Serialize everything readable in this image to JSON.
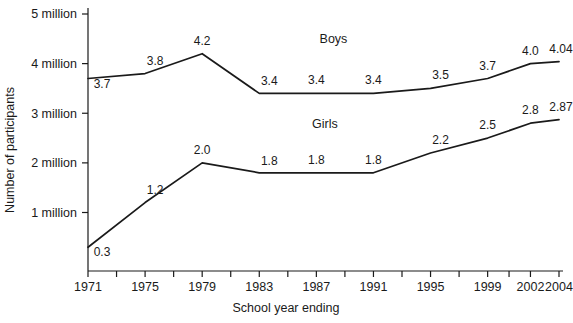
{
  "chart_data": {
    "type": "line",
    "title": "",
    "xlabel": "School year ending",
    "ylabel": "Number of participants",
    "categories": [
      "1971",
      "1975",
      "1979",
      "1983",
      "1987",
      "1991",
      "1995",
      "1999",
      "2002",
      "2004"
    ],
    "x_tick_labels": [
      "1971",
      "1975",
      "1979",
      "1983",
      "1987",
      "1991",
      "1995",
      "1999",
      "2002",
      "2004"
    ],
    "y_tick_labels": [
      "1 million",
      "2 million",
      "3 million",
      "4 million",
      "5 million"
    ],
    "y_tick_values": [
      1,
      2,
      3,
      4,
      5
    ],
    "ylim": [
      0,
      5
    ],
    "xlim": [
      1971,
      2004
    ],
    "grid": false,
    "legend_position": "inline-labels",
    "units": "millions of participants",
    "series": [
      {
        "name": "Boys",
        "values": [
          3.7,
          3.8,
          4.2,
          3.4,
          3.4,
          3.4,
          3.5,
          3.7,
          4.0,
          4.04
        ],
        "labels": [
          "3.7",
          "3.8",
          "4.2",
          "3.4",
          "3.4",
          "3.4",
          "3.5",
          "3.7",
          "4.0",
          "4.04"
        ],
        "color": "#1a1a1a"
      },
      {
        "name": "Girls",
        "values": [
          0.3,
          1.2,
          2.0,
          1.8,
          1.8,
          1.8,
          2.2,
          2.5,
          2.8,
          2.87
        ],
        "labels": [
          "0.3",
          "1.2",
          "2.0",
          "1.8",
          "1.8",
          "1.8",
          "2.2",
          "2.5",
          "2.8",
          "2.87"
        ],
        "color": "#1a1a1a"
      }
    ],
    "series_label_positions": {
      "Boys": {
        "x": 1988.2,
        "y": 4.42
      },
      "Girls": {
        "x": 1987.6,
        "y": 2.7
      }
    },
    "colors": {
      "axis": "#1a1a1a",
      "line": "#1a1a1a",
      "background": "#ffffff"
    }
  }
}
